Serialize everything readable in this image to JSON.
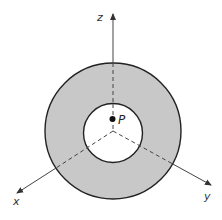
{
  "diagram": {
    "colors": {
      "background": "#ffffff",
      "annulus_fill": "#c8c8c8",
      "hole_fill": "#ffffff",
      "stroke": "#222222",
      "axis": "#444444"
    },
    "labels": {
      "z_axis": "z",
      "x_axis": "x",
      "y_axis": "y",
      "point": "P"
    }
  }
}
